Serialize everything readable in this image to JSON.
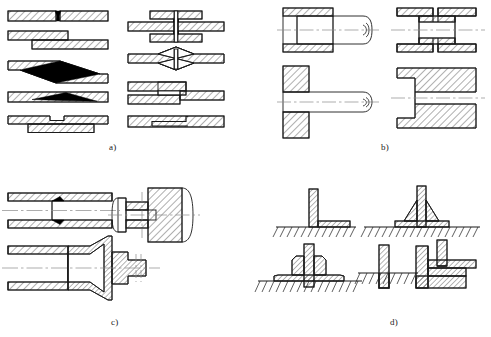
{
  "figure": {
    "background_color": "#ffffff",
    "line_color": "#1a1a1a",
    "hatch_color": "#1a1a1a",
    "fill_color": "#ffffff",
    "centerline_color": "#7a7a7a",
    "weld_fill_color": "#000000",
    "width": 491,
    "height": 337
  },
  "panels": [
    {
      "id": "a",
      "caption": "a)",
      "caption_x": 112,
      "caption_y": 148,
      "description": "Sheet / plate lap and butt joints, ten cross-section variants in two columns",
      "items": [
        {
          "name": "butt-joint-square-edge",
          "column": "left",
          "row": 1
        },
        {
          "name": "lap-joint-offset-plates",
          "column": "left",
          "row": 2
        },
        {
          "name": "scarf-joint-long-taper",
          "column": "left",
          "row": 3
        },
        {
          "name": "scarf-joint-thin-taper",
          "column": "left",
          "row": 4
        },
        {
          "name": "stepped-lap-joint-strap",
          "column": "left",
          "row": 5
        },
        {
          "name": "double-strap-butt-joint",
          "column": "right",
          "row": 1
        },
        {
          "name": "double-taper-diamond-butt-joint",
          "column": "right",
          "row": 2
        },
        {
          "name": "offset-lap-joint-stepped",
          "column": "right",
          "row": 3
        },
        {
          "name": "inset-stepped-butt-joint",
          "column": "right",
          "row": 4
        }
      ]
    },
    {
      "id": "b",
      "caption": "b)",
      "caption_x": 381,
      "caption_y": 148,
      "description": "Tube / shaft into socket joints, four cross-section variants",
      "items": [
        {
          "name": "tube-in-sleeve-socket-joint",
          "position": "top-left"
        },
        {
          "name": "tube-coupling-sleeve-joint",
          "position": "top-right"
        },
        {
          "name": "shaft-through-plate-joint",
          "position": "bottom-left"
        },
        {
          "name": "shaft-in-blind-bore-joint",
          "position": "bottom-right"
        }
      ]
    },
    {
      "id": "c",
      "caption": "c)",
      "caption_x": 114,
      "caption_y": 320,
      "description": "Tube-to-tube and tube-to-fitting joints, three cross-section variants",
      "items": [
        {
          "name": "tube-butt-joint-internal-sleeve",
          "position": "top-left"
        },
        {
          "name": "tube-to-solid-plug-joint",
          "position": "top-right"
        },
        {
          "name": "tube-to-flared-nozzle-joint",
          "position": "bottom"
        }
      ]
    },
    {
      "id": "d",
      "caption": "d)",
      "caption_x": 392,
      "caption_y": 320,
      "description": "Plate-to-base fillet and tee joints, five cross-section variants",
      "items": [
        {
          "name": "corner-fillet-joint",
          "position": "top-left"
        },
        {
          "name": "tee-joint-double-fillet-on-pad",
          "position": "top-right"
        },
        {
          "name": "tee-joint-double-fillet-raised",
          "position": "mid-left"
        },
        {
          "name": "plate-in-slot-joint",
          "position": "bottom-center"
        },
        {
          "name": "corner-lap-joint-stepped",
          "position": "bottom-right"
        }
      ]
    }
  ]
}
